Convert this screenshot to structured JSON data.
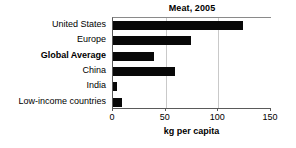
{
  "chart_data": {
    "type": "bar",
    "orientation": "horizontal",
    "title": "Meat, 2005",
    "xlabel": "kg per capita",
    "ylabel": "",
    "categories": [
      "United States",
      "Europe",
      "Global Average",
      "China",
      "India",
      "Low-income countries"
    ],
    "values": [
      123,
      74,
      39,
      59,
      4,
      9
    ],
    "highlighted_categories": [
      "Global Average"
    ],
    "xlim": [
      0,
      150
    ],
    "xticks": [
      0,
      50,
      100,
      150
    ],
    "xtick_labels": [
      "0",
      "50",
      "100",
      "150"
    ],
    "grid": "vertical",
    "legend": "none",
    "bar_color": "#080808",
    "series": [
      {
        "name": "Meat consumption",
        "values": [
          123,
          74,
          39,
          59,
          4,
          9
        ]
      }
    ]
  },
  "colors": {
    "bar": "#080808",
    "gridline": "#c9c9c9",
    "axis": "#5a5a5a",
    "background": "#ffffff",
    "text": "#000000"
  }
}
